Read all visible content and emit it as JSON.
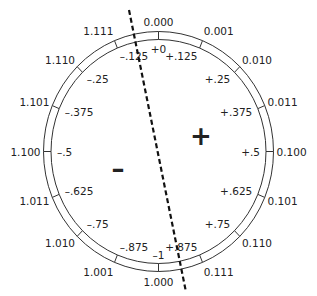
{
  "diagram": {
    "title": "",
    "colors": {
      "stroke": "#333333",
      "text": "#222222",
      "background": "#ffffff"
    },
    "regions": {
      "positive_sign": "+",
      "negative_sign": "–"
    },
    "segments": [
      {
        "bits": "0.000",
        "value": "+0"
      },
      {
        "bits": "0.001",
        "value": "+.125"
      },
      {
        "bits": "0.010",
        "value": "+.25"
      },
      {
        "bits": "0.011",
        "value": "+.375"
      },
      {
        "bits": "0.100",
        "value": "+.5"
      },
      {
        "bits": "0.101",
        "value": "+.625"
      },
      {
        "bits": "0.110",
        "value": "+.75"
      },
      {
        "bits": "0.111",
        "value": "+.875"
      },
      {
        "bits": "1.000",
        "value": "–1"
      },
      {
        "bits": "1.001",
        "value": "–.875"
      },
      {
        "bits": "1.010",
        "value": "–.75"
      },
      {
        "bits": "1.011",
        "value": "–.625"
      },
      {
        "bits": "1.100",
        "value": "–.5"
      },
      {
        "bits": "1.101",
        "value": "–.375"
      },
      {
        "bits": "1.110",
        "value": "–.25"
      },
      {
        "bits": "1.111",
        "value": "–.125"
      }
    ]
  }
}
